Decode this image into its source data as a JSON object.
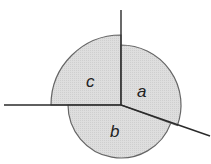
{
  "diagram": {
    "center": [
      121,
      105
    ],
    "fill_color": "#dcdcdc",
    "stroke_color": "#555555",
    "line_color": "#2a2a2a",
    "sectors": [
      {
        "label": "a",
        "radius": 60,
        "start_deg": -90,
        "end_deg": 20,
        "label_pos": [
          142,
          95
        ]
      },
      {
        "label": "b",
        "radius": 53,
        "start_deg": 20,
        "end_deg": 180,
        "label_pos": [
          110,
          133
        ]
      },
      {
        "label": "c",
        "radius": 70,
        "start_deg": 180,
        "end_deg": 270,
        "label_pos": [
          88,
          82
        ]
      }
    ],
    "rays": [
      {
        "name": "up",
        "to": [
          121,
          10
        ]
      },
      {
        "name": "left",
        "to": [
          4,
          105
        ]
      },
      {
        "name": "lower-right",
        "to": [
          210,
          136
        ]
      }
    ]
  }
}
